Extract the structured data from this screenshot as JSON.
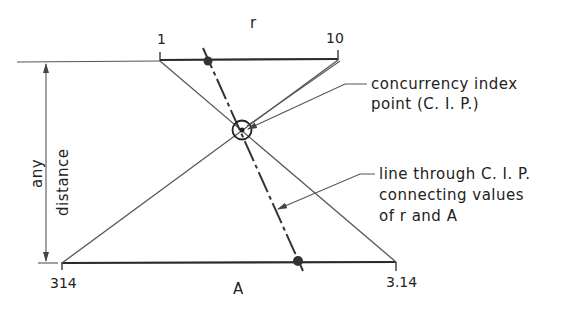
{
  "diagram": {
    "type": "nomograph",
    "top_scale": {
      "name": "r",
      "start_label": "1",
      "end_label": "10"
    },
    "bottom_scale": {
      "name": "A",
      "start_label": "314",
      "end_label": "3.14"
    },
    "dimension": {
      "line1": "any",
      "line2": "distance"
    },
    "callouts": {
      "cip": {
        "line1": "concurrency index",
        "line2": "point (C. I. P.)"
      },
      "through_line": {
        "line1": "line through C. I. P.",
        "line2": "connecting values",
        "line3": "of r and A"
      }
    },
    "colors": {
      "line": "#2a2a2a",
      "thin_line": "#555555",
      "text": "#222222"
    }
  }
}
